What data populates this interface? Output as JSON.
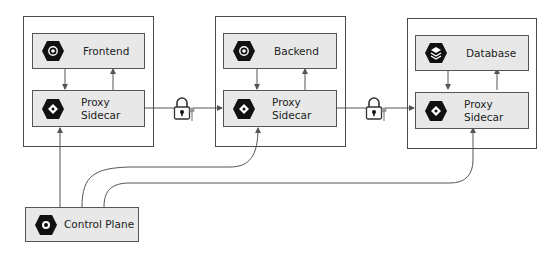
{
  "services": [
    {
      "name": "Frontend",
      "icon": "gear-hex-icon"
    },
    {
      "name": "Backend",
      "icon": "gear-hex-icon"
    },
    {
      "name": "Database",
      "icon": "stack-hex-icon"
    }
  ],
  "sidecar": {
    "line1": "Proxy",
    "line2": "Sidecar",
    "icon": "diamond-hex-icon"
  },
  "control_plane": {
    "label": "Control Plane",
    "icon": "nut-hex-icon"
  },
  "links": [
    {
      "from": "Frontend Proxy Sidecar",
      "to": "Backend Proxy Sidecar",
      "secured": true
    },
    {
      "from": "Backend Proxy Sidecar",
      "to": "Database Proxy Sidecar",
      "secured": true
    }
  ],
  "colors": {
    "node_fill": "#e8e8e8",
    "border": "#4a4a4a",
    "icon": "#111111"
  }
}
